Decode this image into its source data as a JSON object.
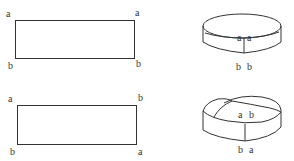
{
  "figure": {
    "stroke_color": "#333333",
    "background": "#ffffff"
  },
  "panels": [
    {
      "name": "cylinder",
      "rectangle_labels": {
        "top_left": "a",
        "top_right": "a",
        "bottom_left": "b",
        "bottom_right": "b"
      },
      "shape_labels": {
        "seam_top_left": "a",
        "seam_top_right": "a",
        "seam_bottom_left": "b",
        "seam_bottom_right": "b"
      }
    },
    {
      "name": "mobius",
      "rectangle_labels": {
        "top_left": "a",
        "top_right": "b",
        "bottom_left": "b",
        "bottom_right": "a"
      },
      "shape_labels": {
        "seam_top_left": "a",
        "seam_top_right": "b",
        "seam_bottom_left": "b",
        "seam_bottom_right": "a"
      }
    }
  ]
}
